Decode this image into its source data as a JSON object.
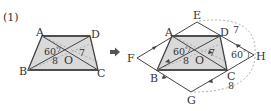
{
  "problem": {
    "number_label": "(1)"
  },
  "colors": {
    "fill": "#d9d9d9",
    "stroke": "#444444",
    "dashed": "#999999",
    "text": "#333333"
  },
  "left_figure": {
    "vertices": {
      "A": "A",
      "B": "B",
      "C": "C",
      "D": "D",
      "O": "O"
    },
    "angle_label": "60",
    "angle_unit": "°",
    "segment_labels": {
      "BO": "8",
      "DO": "7"
    }
  },
  "arrow": {
    "symbol": "➡"
  },
  "right_figure": {
    "vertices": {
      "A": "A",
      "B": "B",
      "C": "C",
      "D": "D",
      "O": "O",
      "E": "E",
      "F": "F",
      "G": "G",
      "H": "H"
    },
    "angle_labels": {
      "AOB": "60",
      "DHC": "60"
    },
    "angle_unit": "°",
    "segment_labels": {
      "BO": "8",
      "DO": "7",
      "DH": "7",
      "CG": "8"
    }
  }
}
